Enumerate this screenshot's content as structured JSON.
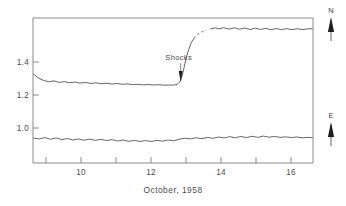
{
  "chart_data": {
    "type": "line",
    "title": "",
    "subtitle": "",
    "xlabel": "October, 1958",
    "ylabel": "",
    "xlim": [
      8.6,
      16.6
    ],
    "ylim": [
      0.8,
      1.57
    ],
    "grid": false,
    "legend_position": "right-outside",
    "xticks": [
      9,
      10,
      11,
      12,
      13,
      14,
      15,
      16
    ],
    "xticklabels": [
      "",
      "10",
      "",
      "12",
      "",
      "14",
      "",
      "16"
    ],
    "yticks": [
      1.0,
      1.2,
      1.4
    ],
    "yticklabels": [
      "1.0",
      "1.2",
      "1.4"
    ],
    "annotations": [
      {
        "text": "Shocks",
        "x": 12.82,
        "y": 1.3,
        "arrow": "down",
        "points_to_x": 12.82,
        "points_to_y": 1.22
      }
    ],
    "series": [
      {
        "name": "N",
        "label": "N",
        "style": "solid-with-dashed-gap",
        "x": [
          8.62,
          8.75,
          8.9,
          9.05,
          9.2,
          9.35,
          9.5,
          9.65,
          9.8,
          9.95,
          10.1,
          10.25,
          10.4,
          10.55,
          10.7,
          10.85,
          11.0,
          11.15,
          11.3,
          11.45,
          11.6,
          11.75,
          11.9,
          12.05,
          12.2,
          12.35,
          12.5,
          12.62,
          12.72,
          12.8,
          12.86,
          12.92,
          12.98,
          13.05,
          13.12,
          13.2,
          13.3,
          13.42,
          13.55,
          13.68,
          13.8,
          13.92,
          14.05,
          14.2,
          14.35,
          14.5,
          14.65,
          14.8,
          14.95,
          15.1,
          15.25,
          15.4,
          15.55,
          15.7,
          15.85,
          16.0,
          16.15,
          16.3,
          16.45,
          16.58
        ],
        "y": [
          1.272,
          1.252,
          1.238,
          1.232,
          1.236,
          1.228,
          1.232,
          1.226,
          1.23,
          1.224,
          1.228,
          1.222,
          1.226,
          1.221,
          1.224,
          1.219,
          1.222,
          1.218,
          1.22,
          1.216,
          1.218,
          1.215,
          1.217,
          1.214,
          1.216,
          1.213,
          1.214,
          1.214,
          1.218,
          1.232,
          1.262,
          1.31,
          1.36,
          1.404,
          1.438,
          1.462,
          1.482,
          1.496,
          1.505,
          1.512,
          1.518,
          1.512,
          1.519,
          1.511,
          1.518,
          1.51,
          1.517,
          1.509,
          1.516,
          1.509,
          1.515,
          1.508,
          1.514,
          1.508,
          1.514,
          1.508,
          1.513,
          1.508,
          1.513,
          1.512
        ]
      },
      {
        "name": "E",
        "label": "E",
        "style": "solid",
        "x": [
          8.62,
          8.78,
          8.94,
          9.1,
          9.26,
          9.42,
          9.58,
          9.74,
          9.9,
          10.06,
          10.22,
          10.38,
          10.54,
          10.7,
          10.86,
          11.02,
          11.18,
          11.34,
          11.5,
          11.66,
          11.82,
          11.98,
          12.14,
          12.3,
          12.46,
          12.62,
          12.78,
          12.94,
          13.1,
          13.26,
          13.42,
          13.58,
          13.74,
          13.9,
          14.06,
          14.22,
          14.38,
          14.54,
          14.7,
          14.86,
          15.02,
          15.18,
          15.34,
          15.5,
          15.66,
          15.82,
          15.98,
          16.14,
          16.3,
          16.46,
          16.58
        ],
        "y": [
          0.932,
          0.928,
          0.935,
          0.926,
          0.933,
          0.924,
          0.93,
          0.922,
          0.928,
          0.921,
          0.927,
          0.92,
          0.926,
          0.919,
          0.924,
          0.917,
          0.922,
          0.915,
          0.92,
          0.914,
          0.919,
          0.914,
          0.92,
          0.916,
          0.922,
          0.918,
          0.926,
          0.932,
          0.928,
          0.934,
          0.929,
          0.936,
          0.931,
          0.938,
          0.933,
          0.94,
          0.934,
          0.941,
          0.935,
          0.942,
          0.936,
          0.943,
          0.937,
          0.941,
          0.936,
          0.939,
          0.935,
          0.938,
          0.934,
          0.936,
          0.935
        ]
      }
    ],
    "dashed_segment": {
      "series": "N",
      "x_start": 13.2,
      "x_end": 13.62,
      "note": "interpolated gap in trace"
    }
  },
  "markers": {
    "north": {
      "label": "N",
      "icon": "up-arrow-icon"
    },
    "east": {
      "label": "E",
      "icon": "up-arrow-icon"
    }
  },
  "colors": {
    "trace": "#4a4a4a",
    "axis": "#7d7d7d",
    "text": "#3a3a3a",
    "background": "#ffffff"
  }
}
